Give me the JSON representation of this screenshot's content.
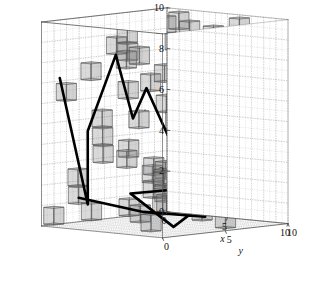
{
  "figure": {
    "kind": "3d-voxel-path-plot",
    "background_color": "#ffffff",
    "box_edge_color": "#555555",
    "grid_color": "#9a9a9a",
    "cube_fill_color": "#808080",
    "cube_edge_color": "#4d4d4d",
    "path_color": "#000000",
    "path_width": 2.6
  },
  "axes": {
    "x": {
      "label": "x",
      "ticks": [
        "0",
        "5",
        "10"
      ],
      "tick_values": [
        0,
        5,
        10
      ],
      "range": [
        0,
        10
      ]
    },
    "y": {
      "label": "y",
      "ticks": [
        "0",
        "5",
        "10"
      ],
      "tick_values": [
        0,
        5,
        10
      ],
      "range": [
        0,
        10
      ]
    },
    "z": {
      "label": "z",
      "ticks": [
        "0",
        "2",
        "4",
        "6",
        "8",
        "10"
      ],
      "tick_values": [
        0,
        2,
        4,
        6,
        8,
        10
      ],
      "range": [
        0,
        10
      ]
    }
  },
  "chart_data": {
    "type": "scatter",
    "title": "",
    "xlabel": "x",
    "ylabel": "y",
    "zlabel": "z",
    "xlim": [
      0,
      10
    ],
    "ylim": [
      0,
      10
    ],
    "zlim": [
      0,
      10
    ],
    "grid": true,
    "legend": null,
    "cubes": [
      [
        0,
        0,
        0
      ],
      [
        0,
        3,
        0
      ],
      [
        0,
        6,
        0
      ],
      [
        0,
        9,
        0
      ],
      [
        1,
        1,
        1
      ],
      [
        1,
        5,
        3
      ],
      [
        1,
        8,
        5
      ],
      [
        1,
        2,
        7
      ],
      [
        2,
        0,
        2
      ],
      [
        2,
        4,
        6
      ],
      [
        2,
        7,
        9
      ],
      [
        2,
        9,
        1
      ],
      [
        3,
        1,
        4
      ],
      [
        3,
        3,
        8
      ],
      [
        3,
        6,
        2
      ],
      [
        3,
        8,
        6
      ],
      [
        4,
        0,
        5
      ],
      [
        4,
        2,
        9
      ],
      [
        4,
        5,
        1
      ],
      [
        4,
        9,
        7
      ],
      [
        5,
        1,
        3
      ],
      [
        5,
        4,
        7
      ],
      [
        5,
        7,
        0
      ],
      [
        5,
        8,
        4
      ],
      [
        6,
        0,
        8
      ],
      [
        6,
        3,
        2
      ],
      [
        6,
        5,
        6
      ],
      [
        6,
        9,
        9
      ],
      [
        7,
        1,
        0
      ],
      [
        7,
        4,
        4
      ],
      [
        7,
        6,
        8
      ],
      [
        7,
        8,
        1
      ],
      [
        8,
        2,
        5
      ],
      [
        8,
        5,
        9
      ],
      [
        8,
        7,
        3
      ],
      [
        8,
        9,
        6
      ],
      [
        9,
        0,
        1
      ],
      [
        9,
        3,
        5
      ],
      [
        9,
        6,
        7
      ],
      [
        9,
        8,
        2
      ],
      [
        0,
        5,
        8
      ],
      [
        2,
        2,
        3
      ],
      [
        4,
        7,
        5
      ],
      [
        6,
        7,
        4
      ],
      [
        8,
        0,
        7
      ],
      [
        1,
        9,
        9
      ],
      [
        3,
        9,
        3
      ],
      [
        5,
        2,
        8
      ],
      [
        7,
        9,
        5
      ],
      [
        9,
        5,
        0
      ],
      [
        0,
        1,
        6
      ],
      [
        2,
        6,
        1
      ],
      [
        4,
        4,
        2
      ],
      [
        6,
        1,
        5
      ],
      [
        8,
        3,
        8
      ],
      [
        3,
        4,
        0
      ],
      [
        5,
        6,
        9
      ],
      [
        7,
        2,
        2
      ],
      [
        9,
        1,
        9
      ],
      [
        1,
        7,
        2
      ]
    ],
    "path": [
      [
        1.2,
        0.3,
        7.3
      ],
      [
        3.2,
        0.6,
        1.2
      ],
      [
        3.2,
        0.6,
        4.8
      ],
      [
        5.0,
        1.1,
        8.6
      ],
      [
        5.9,
        1.6,
        5.5
      ],
      [
        6.6,
        2.0,
        7.0
      ],
      [
        7.6,
        3.5,
        3.6
      ],
      [
        6.6,
        5.0,
        5.0
      ],
      [
        8.0,
        6.2,
        4.3
      ],
      [
        6.5,
        7.0,
        4.0
      ],
      [
        8.6,
        8.3,
        2.6
      ],
      [
        5.2,
        8.8,
        0.9
      ],
      [
        3.6,
        7.0,
        1.5
      ],
      [
        3.2,
        4.0,
        1.5
      ],
      [
        5.4,
        2.2,
        1.6
      ],
      [
        7.8,
        3.0,
        0.2
      ],
      [
        9.2,
        5.5,
        1.9
      ],
      [
        6.4,
        6.6,
        1.3
      ],
      [
        4.4,
        8.8,
        0.1
      ],
      [
        2.2,
        6.0,
        0.4
      ],
      [
        1.0,
        2.0,
        1.3
      ]
    ],
    "n_cubes": 60,
    "n_path_points": 21
  }
}
